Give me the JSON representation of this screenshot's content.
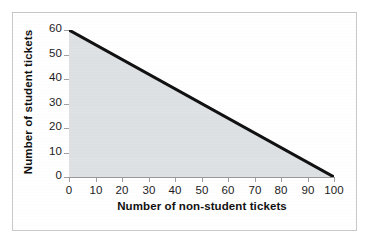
{
  "chart_data": {
    "type": "line",
    "title": "",
    "xlabel": "Number of non-student tickets",
    "ylabel": "Number of student tickets",
    "xlim": [
      0,
      100
    ],
    "ylim": [
      0,
      60
    ],
    "xticks": [
      "0",
      "10",
      "20",
      "30",
      "40",
      "50",
      "60",
      "70",
      "80",
      "90",
      "100"
    ],
    "yticks": [
      "0",
      "10",
      "20",
      "30",
      "40",
      "50",
      "60"
    ],
    "xtick_values": [
      0,
      10,
      20,
      30,
      40,
      50,
      60,
      70,
      80,
      90,
      100
    ],
    "ytick_values": [
      0,
      10,
      20,
      30,
      40,
      50,
      60
    ],
    "grid": false,
    "legend": null,
    "series": [
      {
        "name": "constraint-line",
        "x": [
          0,
          100
        ],
        "values": [
          60,
          0
        ],
        "color": "#111111",
        "line_width": 3,
        "shaded_region_below": true,
        "shade_color": "#dde1e4"
      }
    ],
    "annotations": []
  },
  "figure": {
    "plot_background": "#dde1e4",
    "page_background": "#ffffff",
    "frame_color": "#c9c9c9",
    "axis_color": "#9a9a9a",
    "tick_color": "#a0a0a0",
    "text_color": "#1c1c1c"
  }
}
